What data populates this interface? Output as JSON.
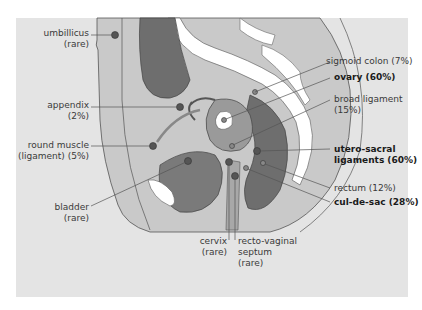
{
  "diagram": {
    "title": "",
    "colors": {
      "panel_bg": "#e4e4e4",
      "body_light": "#c9c9c9",
      "organ_mid": "#9a9a9a",
      "organ_dark": "#6e6e6e",
      "bone": "#ffffff",
      "lines": "#444444",
      "marker": "#555555"
    },
    "labels_left": [
      {
        "id": "umbilicus",
        "line1": "umbillicus",
        "line2": "(rare)",
        "bold": false
      },
      {
        "id": "appendix",
        "line1": "appendix",
        "line2": "(2%)",
        "bold": false
      },
      {
        "id": "round-muscle",
        "line1": "round muscle",
        "line2": "(ligament) (5%)",
        "bold": false
      },
      {
        "id": "bladder",
        "line1": "bladder",
        "line2": "(rare)",
        "bold": false
      }
    ],
    "labels_right": [
      {
        "id": "sigmoid-colon",
        "line1": "sigmoid colon (7%)",
        "line2": "",
        "bold": false
      },
      {
        "id": "ovary",
        "line1": "ovary (60%)",
        "line2": "",
        "bold": true
      },
      {
        "id": "broad-ligament",
        "line1": "broad ligament",
        "line2": "(15%)",
        "bold": false
      },
      {
        "id": "utero-sacral",
        "line1": "utero-sacral",
        "line2": "ligaments (60%)",
        "bold": true
      },
      {
        "id": "rectum",
        "line1": "rectum (12%)",
        "line2": "",
        "bold": false
      },
      {
        "id": "cul-de-sac",
        "line1": "cul-de-sac (28%)",
        "line2": "",
        "bold": true
      }
    ],
    "labels_bottom": [
      {
        "id": "cervix",
        "line1": "cervix",
        "line2": "(rare)",
        "line3": "",
        "bold": false
      },
      {
        "id": "recto-vaginal",
        "line1": "recto-vaginal",
        "line2": "septum",
        "line3": "(rare)",
        "bold": false
      }
    ]
  }
}
